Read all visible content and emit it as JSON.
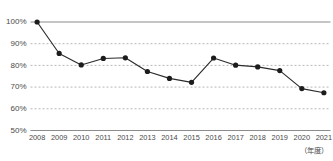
{
  "chart_data": {
    "type": "line",
    "title": "",
    "subtitle": "",
    "xlabel": "（年度）",
    "ylabel": "",
    "categories": [
      "2008",
      "2009",
      "2010",
      "2011",
      "2012",
      "2013",
      "2014",
      "2015",
      "2016",
      "2017",
      "2018",
      "2019",
      "2020",
      "2021"
    ],
    "values": [
      100,
      85.5,
      80.2,
      83.2,
      83.5,
      77.2,
      74.0,
      72.2,
      83.4,
      80.1,
      79.3,
      77.6,
      69.3,
      67.4
    ],
    "series": [
      {
        "name": "",
        "values": [
          100,
          85.5,
          80.2,
          83.2,
          83.5,
          77.2,
          74.0,
          72.2,
          83.4,
          80.1,
          79.3,
          77.6,
          69.3,
          67.4
        ]
      }
    ],
    "ylim": [
      50,
      100
    ],
    "ytick_labels": [
      "100%",
      "90%",
      "80%",
      "70%",
      "60%",
      "50%"
    ],
    "ytick_values": [
      100,
      90,
      80,
      70,
      60,
      50
    ],
    "grid": true,
    "grid_axis": "y",
    "legend": false,
    "legend_position": "none",
    "marker": "circle",
    "colors": {
      "line": "#2b2b2b",
      "marker": "#1c1c1c",
      "grid": "#9a9a9a",
      "axis": "#8c8c8c",
      "text": "#4a4a4a",
      "background": "#ffffff"
    }
  },
  "axis_caption": "（年度）"
}
